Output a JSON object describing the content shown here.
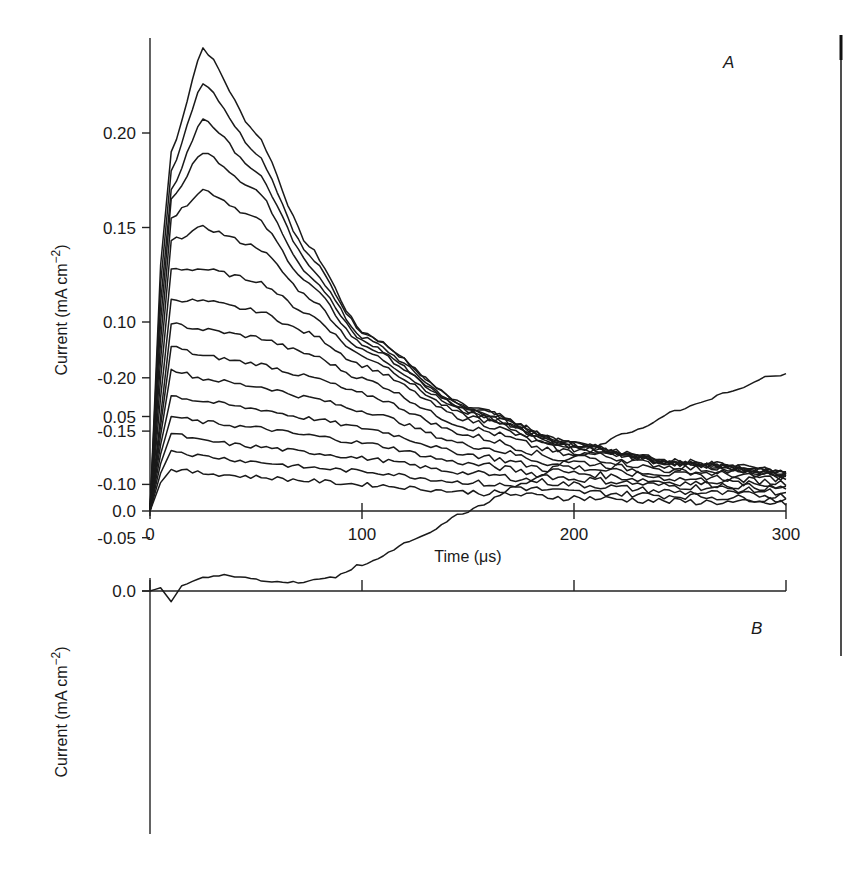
{
  "panel_labels": {
    "a": "A",
    "b": "B"
  },
  "panel_a": {
    "ylabel": "Current (mA cm",
    "ylabel_sup": "−2",
    "ylabel_close": ")",
    "xlabel": "Time (μs)",
    "yticks": [
      "0.0",
      "0.05",
      "0.10",
      "0.15",
      "0.20"
    ],
    "xticks": [
      "0",
      "100",
      "200",
      "300"
    ]
  },
  "panel_b": {
    "ylabel": "Current (mA cm",
    "ylabel_sup": "−2",
    "ylabel_close": ")",
    "yticks": [
      "0.0",
      "-0.05",
      "-0.10",
      "-0.15",
      "-0.20"
    ]
  },
  "chart_data": [
    {
      "panel": "A",
      "type": "line",
      "title": "",
      "xlabel": "Time (μs)",
      "ylabel": "Current (mA cm^-2)",
      "xlim": [
        0,
        300
      ],
      "ylim": [
        0,
        0.25
      ],
      "xticks": [
        0,
        100,
        200,
        300
      ],
      "yticks": [
        0.0,
        0.05,
        0.1,
        0.15,
        0.2
      ],
      "grid": false,
      "legend": null,
      "annotation": "A",
      "description": "Family of ~16 transient current traces; each rises steeply from 0 within ~10 μs, peaks near 25–30 μs, then decays; larger traces converge onto a common decay envelope approaching ~0.02 at 300 μs.",
      "x": [
        0,
        5,
        10,
        25,
        50,
        75,
        100,
        150,
        200,
        250,
        300
      ],
      "series": [
        {
          "name": "trace 1",
          "values": [
            0,
            0.13,
            0.19,
            0.245,
            0.2,
            0.14,
            0.095,
            0.055,
            0.035,
            0.025,
            0.02
          ]
        },
        {
          "name": "trace 2",
          "values": [
            0,
            0.12,
            0.18,
            0.227,
            0.19,
            0.135,
            0.095,
            0.055,
            0.035,
            0.025,
            0.02
          ]
        },
        {
          "name": "trace 3",
          "values": [
            0,
            0.11,
            0.17,
            0.208,
            0.18,
            0.13,
            0.092,
            0.054,
            0.035,
            0.026,
            0.021
          ]
        },
        {
          "name": "trace 4",
          "values": [
            0,
            0.1,
            0.165,
            0.19,
            0.17,
            0.125,
            0.09,
            0.053,
            0.035,
            0.026,
            0.021
          ]
        },
        {
          "name": "trace 5",
          "values": [
            0,
            0.09,
            0.155,
            0.17,
            0.155,
            0.12,
            0.088,
            0.053,
            0.034,
            0.026,
            0.02
          ]
        },
        {
          "name": "trace 6",
          "values": [
            0,
            0.08,
            0.143,
            0.15,
            0.14,
            0.113,
            0.085,
            0.052,
            0.034,
            0.025,
            0.02
          ]
        },
        {
          "name": "trace 7",
          "values": [
            0,
            0.07,
            0.128,
            0.128,
            0.122,
            0.104,
            0.082,
            0.05,
            0.033,
            0.025,
            0.019
          ]
        },
        {
          "name": "trace 8",
          "values": [
            0,
            0.06,
            0.112,
            0.111,
            0.106,
            0.094,
            0.077,
            0.048,
            0.031,
            0.023,
            0.018
          ]
        },
        {
          "name": "trace 9",
          "values": [
            0,
            0.05,
            0.099,
            0.096,
            0.092,
            0.083,
            0.07,
            0.044,
            0.029,
            0.021,
            0.017
          ]
        },
        {
          "name": "trace 10",
          "values": [
            0,
            0.045,
            0.087,
            0.082,
            0.078,
            0.071,
            0.062,
            0.04,
            0.026,
            0.019,
            0.015
          ]
        },
        {
          "name": "trace 11",
          "values": [
            0,
            0.04,
            0.075,
            0.07,
            0.066,
            0.06,
            0.053,
            0.035,
            0.023,
            0.017,
            0.013
          ]
        },
        {
          "name": "trace 12",
          "values": [
            0,
            0.035,
            0.061,
            0.058,
            0.054,
            0.049,
            0.044,
            0.03,
            0.02,
            0.015,
            0.012
          ]
        },
        {
          "name": "trace 13",
          "values": [
            0,
            0.03,
            0.05,
            0.047,
            0.044,
            0.04,
            0.036,
            0.025,
            0.017,
            0.013,
            0.01
          ]
        },
        {
          "name": "trace 14",
          "values": [
            0,
            0.025,
            0.041,
            0.037,
            0.034,
            0.031,
            0.028,
            0.02,
            0.014,
            0.01,
            0.008
          ]
        },
        {
          "name": "trace 15",
          "values": [
            0,
            0.02,
            0.032,
            0.029,
            0.026,
            0.023,
            0.021,
            0.015,
            0.01,
            0.008,
            0.006
          ]
        },
        {
          "name": "trace 16",
          "values": [
            0,
            0.015,
            0.022,
            0.02,
            0.018,
            0.016,
            0.014,
            0.01,
            0.007,
            0.005,
            0.004
          ]
        }
      ]
    },
    {
      "panel": "B",
      "type": "line",
      "title": "",
      "xlabel": "",
      "ylabel": "Current (mA cm^-2)",
      "xlim": [
        0,
        300
      ],
      "ylim": [
        -0.22,
        0.01
      ],
      "xticks": [
        0,
        100,
        200,
        300
      ],
      "yticks": [
        0.0,
        -0.05,
        -0.1,
        -0.15,
        -0.2
      ],
      "grid": false,
      "legend": null,
      "annotation": "B",
      "description": "Single difference trace: small positive blip near 10 μs, dips to about -0.015 at ~35 μs, recovers toward -0.008 around 60–80 μs, then declines roughly linearly to about -0.205 at 300 μs.",
      "x": [
        0,
        5,
        10,
        15,
        25,
        35,
        50,
        60,
        70,
        85,
        100,
        125,
        150,
        175,
        200,
        225,
        250,
        275,
        290,
        300
      ],
      "values": [
        0,
        -0.003,
        0.01,
        -0.005,
        -0.013,
        -0.015,
        -0.011,
        -0.008,
        -0.008,
        -0.012,
        -0.025,
        -0.048,
        -0.075,
        -0.1,
        -0.125,
        -0.148,
        -0.17,
        -0.188,
        -0.2,
        -0.204
      ]
    }
  ]
}
